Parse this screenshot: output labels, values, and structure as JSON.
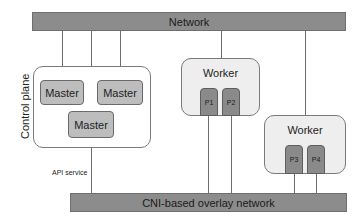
{
  "diagram": {
    "top_network": {
      "label": "Network"
    },
    "bottom_network": {
      "label": "CNI-based overlay network"
    },
    "control_plane": {
      "label": "Control plane",
      "masters": [
        {
          "label": "Master"
        },
        {
          "label": "Master"
        },
        {
          "label": "Master"
        }
      ],
      "link_label": "API service"
    },
    "workers": [
      {
        "label": "Worker",
        "pods": [
          {
            "label": "P1"
          },
          {
            "label": "P2"
          }
        ]
      },
      {
        "label": "Worker",
        "pods": [
          {
            "label": "P3"
          },
          {
            "label": "P4"
          }
        ]
      }
    ],
    "colors": {
      "bar_fill": "#8c8c8c",
      "group_fill": "#eeeeee",
      "master_fill": "#bdbdbd",
      "pod_fill": "#8a8a8a",
      "line": "#6e6e6e"
    }
  }
}
